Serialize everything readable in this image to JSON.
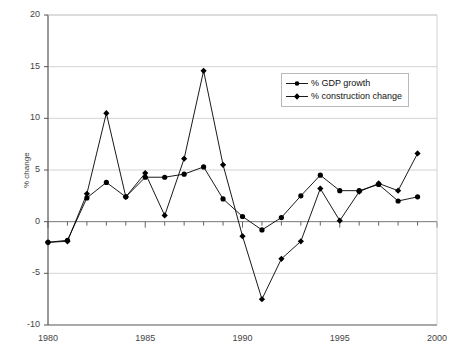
{
  "chart_data": {
    "type": "line",
    "title": "",
    "xlabel": "",
    "ylabel": "% change",
    "xlim": [
      1980,
      2000
    ],
    "ylim": [
      -10,
      20
    ],
    "ytick_values": [
      -10,
      -5,
      0,
      5,
      10,
      15,
      20
    ],
    "ytick_labels": [
      "-10",
      "-5",
      "0",
      "5",
      "10",
      "15",
      "20"
    ],
    "xtick_values": [
      1980,
      1985,
      1990,
      1995,
      2000
    ],
    "xtick_labels": [
      "1980",
      "1985",
      "1990",
      "1995",
      "2000"
    ],
    "x_minor_tick_step": 1,
    "grid": "horizontal",
    "legend_position": "upper-right-inside",
    "x": [
      1980,
      1981,
      1982,
      1983,
      1984,
      1985,
      1986,
      1987,
      1988,
      1989,
      1990,
      1991,
      1992,
      1993,
      1994,
      1995,
      1996,
      1997,
      1998,
      1999
    ],
    "series": [
      {
        "name": "% GDP growth",
        "marker": "circle",
        "color": "#000000",
        "values": [
          -2.0,
          -1.8,
          2.3,
          3.8,
          2.4,
          4.3,
          4.3,
          4.6,
          5.3,
          2.2,
          0.5,
          -0.8,
          0.4,
          2.5,
          4.5,
          3.0,
          3.0,
          3.6,
          2.0,
          2.4
        ]
      },
      {
        "name": "% construction change",
        "marker": "diamond",
        "color": "#000000",
        "values": [
          -2.0,
          -1.9,
          2.7,
          10.5,
          2.4,
          4.7,
          0.6,
          6.1,
          14.6,
          5.5,
          -1.4,
          -7.5,
          -3.6,
          -1.9,
          3.2,
          0.1,
          2.9,
          3.7,
          3.0,
          6.6
        ]
      }
    ]
  },
  "legend": {
    "items": [
      {
        "label": "% GDP growth",
        "marker": "circle-marker"
      },
      {
        "label": "% construction change",
        "marker": "diamond-marker"
      }
    ]
  },
  "colors": {
    "axis": "#555555",
    "grid": "#c8c8c8",
    "series": "#000000",
    "text": "#3a3a3a",
    "background": "#ffffff"
  }
}
